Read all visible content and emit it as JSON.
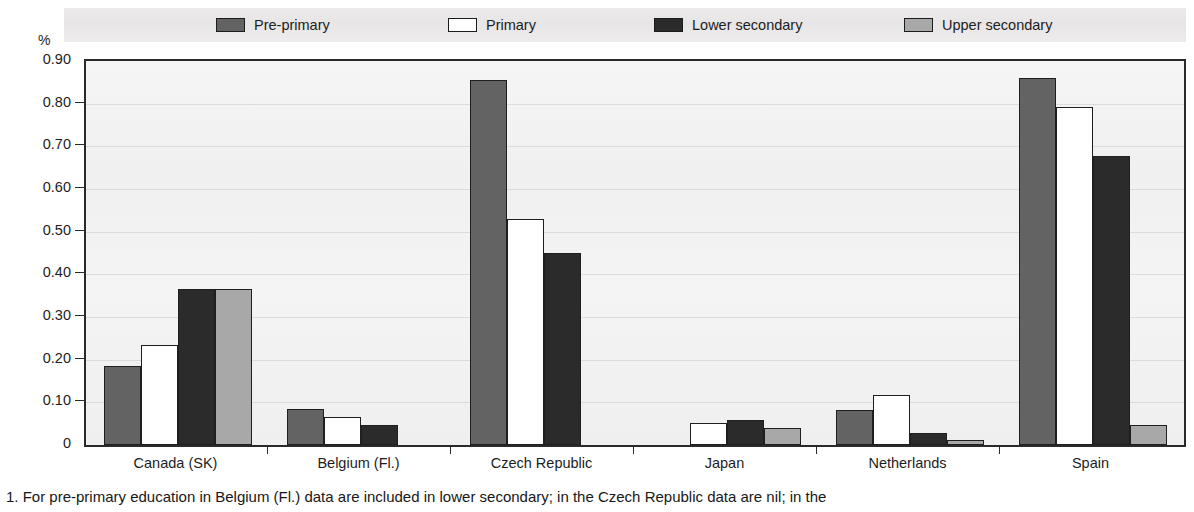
{
  "axis": {
    "unit_label": "%",
    "y_ticks": [
      "0.90",
      "0.80",
      "0.70",
      "0.60",
      "0.50",
      "0.40",
      "0.30",
      "0.20",
      "0.10",
      "0"
    ]
  },
  "legend": {
    "items": [
      {
        "label": "Pre-primary",
        "color": "#636363",
        "name": "pre-primary"
      },
      {
        "label": "Primary",
        "color": "#ffffff",
        "name": "primary"
      },
      {
        "label": "Lower secondary",
        "color": "#2b2b2b",
        "name": "lower-secondary"
      },
      {
        "label": "Upper secondary",
        "color": "#a8a8a8",
        "name": "upper-secondary"
      }
    ]
  },
  "footnote": {
    "text": "1. For pre-primary education in Belgium (Fl.) data are included in lower secondary; in the Czech Republic data are nil; in the"
  },
  "chart_data": {
    "type": "bar",
    "title": "",
    "xlabel": "",
    "ylabel": "%",
    "ylim": [
      0,
      0.9
    ],
    "grid": true,
    "legend_position": "top",
    "categories": [
      "Canada (SK)",
      "Belgium (Fl.)",
      "Czech Republic",
      "Japan",
      "Netherlands",
      "Spain"
    ],
    "series": [
      {
        "name": "Pre-primary",
        "color": "#636363",
        "values": [
          0.185,
          0.085,
          0.855,
          null,
          0.083,
          0.861
        ]
      },
      {
        "name": "Primary",
        "color": "#ffffff",
        "values": [
          0.235,
          0.066,
          0.53,
          0.051,
          0.118,
          0.792
        ]
      },
      {
        "name": "Lower secondary",
        "color": "#2b2b2b",
        "values": [
          0.365,
          0.048,
          0.45,
          0.059,
          0.027,
          0.678
        ]
      },
      {
        "name": "Upper secondary",
        "color": "#a8a8a8",
        "values": [
          0.365,
          null,
          null,
          0.04,
          0.012,
          0.047
        ]
      }
    ]
  }
}
